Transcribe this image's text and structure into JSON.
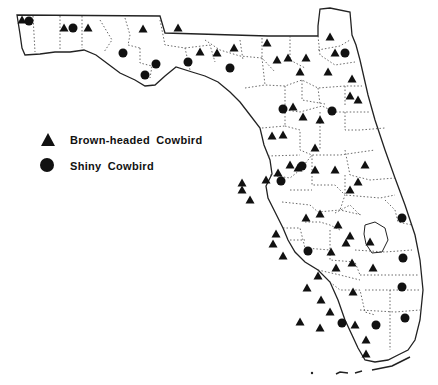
{
  "legend": {
    "items": [
      {
        "symbol": "triangle",
        "label": "Brown-headed Cowbird"
      },
      {
        "symbol": "circle",
        "label": "Shiny Cowbird"
      }
    ]
  },
  "colors": {
    "ink": "#111111",
    "background": "#ffffff"
  },
  "markers": {
    "triangles": [
      [
        22,
        20
      ],
      [
        64,
        28
      ],
      [
        88,
        28
      ],
      [
        143,
        29
      ],
      [
        178,
        28
      ],
      [
        200,
        52
      ],
      [
        217,
        53
      ],
      [
        234,
        48
      ],
      [
        267,
        43
      ],
      [
        277,
        60
      ],
      [
        288,
        58
      ],
      [
        306,
        58
      ],
      [
        300,
        72
      ],
      [
        330,
        37
      ],
      [
        335,
        53
      ],
      [
        328,
        72
      ],
      [
        352,
        79
      ],
      [
        350,
        96
      ],
      [
        358,
        100
      ],
      [
        320,
        120
      ],
      [
        315,
        148
      ],
      [
        293,
        107
      ],
      [
        283,
        135
      ],
      [
        315,
        170
      ],
      [
        272,
        136
      ],
      [
        290,
        165
      ],
      [
        303,
        117
      ],
      [
        278,
        173
      ],
      [
        335,
        170
      ],
      [
        365,
        165
      ],
      [
        358,
        182
      ],
      [
        370,
        242
      ],
      [
        242,
        183
      ],
      [
        242,
        190
      ],
      [
        250,
        200
      ],
      [
        266,
        180
      ],
      [
        306,
        218
      ],
      [
        276,
        234
      ],
      [
        320,
        214
      ],
      [
        338,
        225
      ],
      [
        273,
        244
      ],
      [
        283,
        256
      ],
      [
        307,
        288
      ],
      [
        353,
        292
      ],
      [
        366,
        354
      ],
      [
        350,
        236
      ],
      [
        331,
        252
      ],
      [
        352,
        263
      ],
      [
        373,
        268
      ],
      [
        321,
        300
      ],
      [
        318,
        276
      ],
      [
        330,
        312
      ],
      [
        366,
        340
      ],
      [
        355,
        325
      ],
      [
        320,
        328
      ],
      [
        300,
        322
      ],
      [
        336,
        268
      ],
      [
        346,
        243
      ],
      [
        350,
        190
      ],
      [
        298,
        168
      ]
    ],
    "circles": [
      [
        29,
        21
      ],
      [
        73,
        28
      ],
      [
        123,
        53
      ],
      [
        156,
        64
      ],
      [
        188,
        62
      ],
      [
        145,
        75
      ],
      [
        345,
        53
      ],
      [
        230,
        68
      ],
      [
        283,
        109
      ],
      [
        332,
        111
      ],
      [
        302,
        166
      ],
      [
        281,
        181
      ],
      [
        308,
        251
      ],
      [
        402,
        218
      ],
      [
        403,
        258
      ],
      [
        402,
        287
      ],
      [
        376,
        325
      ],
      [
        405,
        318
      ],
      [
        342,
        323
      ]
    ]
  }
}
